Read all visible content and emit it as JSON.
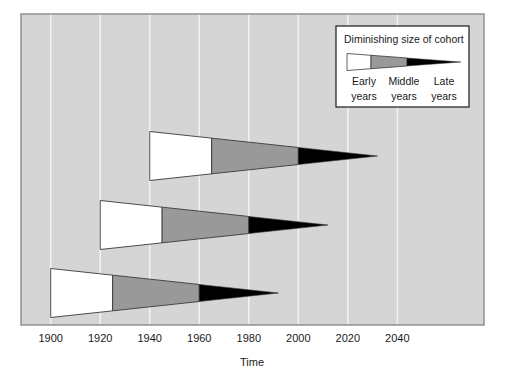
{
  "figure": {
    "width": 508,
    "height": 379,
    "background": "#ffffff",
    "plot_background": "#d5d5d5",
    "plot_border_color": "#8a8a8a",
    "gridline_color": "#f2f2f2",
    "plot_rect": {
      "x": 21,
      "y": 14,
      "width": 463,
      "height": 311
    }
  },
  "chart_data": {
    "type": "area",
    "title": "",
    "xlabel": "Time",
    "ylabel": "",
    "xlim": [
      1888,
      2075
    ],
    "grid": true,
    "legend_position": "top-right",
    "xticks": [
      1900,
      1920,
      1940,
      1960,
      1980,
      2000,
      2020,
      2040
    ],
    "xtick_labels": [
      "1900",
      "1920",
      "1940",
      "1960",
      "1980",
      "2000",
      "2020",
      "2040"
    ],
    "series_name": "Cohort wedges",
    "segment_names": [
      "Early years",
      "Middle years",
      "Late years"
    ],
    "segment_colors": [
      "#ffffff",
      "#999999",
      "#000000"
    ],
    "cohorts": [
      {
        "name": "Cohort born 1940",
        "row": 0,
        "start_year": 1940,
        "white_end_year": 1965,
        "gray_end_year": 2000,
        "tip_year": 2032,
        "start_thickness_px": 49,
        "center_y_px": 156
      },
      {
        "name": "Cohort born 1920",
        "row": 1,
        "start_year": 1920,
        "white_end_year": 1945,
        "gray_end_year": 1980,
        "tip_year": 2012,
        "start_thickness_px": 49,
        "center_y_px": 225
      },
      {
        "name": "Cohort born 1900",
        "row": 2,
        "start_year": 1900,
        "white_end_year": 1925,
        "gray_end_year": 1960,
        "tip_year": 1992,
        "start_thickness_px": 49,
        "center_y_px": 293
      }
    ]
  },
  "legend": {
    "title": "Diminishing size of cohort",
    "box": {
      "x": 336,
      "y": 26,
      "width": 133,
      "height": 81
    },
    "background": "#ffffff",
    "border_color": "#1a1a1a",
    "labels": [
      {
        "text_line1": "Early",
        "text_line2": "years"
      },
      {
        "text_line1": "Middle",
        "text_line2": "years"
      },
      {
        "text_line1": "Late",
        "text_line2": "years"
      }
    ],
    "swatch": {
      "start_x": 347,
      "white_end_x": 371,
      "gray_end_x": 407,
      "tip_x": 461,
      "center_y": 62,
      "start_thickness_px": 17
    }
  },
  "axis": {
    "title": "Time",
    "tick_label_y": 342,
    "axis_title_y": 366
  }
}
